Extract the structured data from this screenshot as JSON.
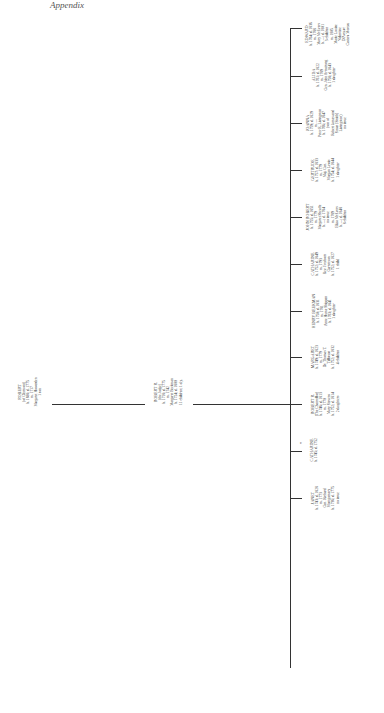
{
  "header": {
    "text": "Appendix"
  },
  "root": {
    "name": "ROBERT",
    "lines": [
      "(of Clermont)",
      "b. 1688; d. 1775",
      "m. 1717",
      "Margaret Howarden",
      "1 son"
    ]
  },
  "middle": {
    "name": "ROBERT R.",
    "lines": [
      "(the Judge)",
      "b. 1718; d. 1775",
      "m. 1742",
      "Margaret Beekman",
      "b. 1724; d. 1800",
      "11 children; 1 d.y."
    ]
  },
  "mark": {
    "text": "c"
  },
  "children": [
    {
      "name": "JANET",
      "lines": [
        "b. 1743; d. 1828",
        "m. 1773",
        "Gen. Richard",
        "Montgomery",
        "b. 1736; d. 1775",
        "no issue"
      ]
    },
    {
      "name": "CATHARINE",
      "lines": [
        "b. 1745; d. 1752"
      ]
    },
    {
      "name": "ROBERT R.",
      "lines": [
        "(The Chancellor)",
        "b. 1746; d. 1813",
        "m. 1770",
        "Mary Stevens",
        "b. 1752; d. 1814",
        "2 daughters"
      ]
    },
    {
      "name": "MARGARET",
      "lines": [
        "b. 1749; d. 1823",
        "m. 1779",
        "Dr. Thomas T.",
        "Tillotson",
        "b. 1752; d. 1832",
        "4 children"
      ]
    },
    {
      "name": "HENRY BEEKMAN",
      "lines": [
        "b. 1750; d. 1831",
        "m. 1781",
        "Anne Hume Shippen",
        "b. 1763; d. 1841",
        "1 daughter"
      ]
    },
    {
      "name": "CATHARINE",
      "lines": [
        "b. 1752; d. 1849",
        "m. 1793",
        "Rev. Freeborn",
        "Garrettson",
        "b. 1752; d. 1827",
        "1 child"
      ]
    },
    {
      "name": "JOHN ROBERT",
      "lines": [
        "b. 1755; d. 1851",
        "m. 1779",
        "Margaret Sheaffe",
        "b. —; d. 1784",
        "no issue",
        "m. 1789",
        "Eliza McEvers",
        "b. —; d. 1848",
        "8 children"
      ]
    },
    {
      "name": "GERTRUDE",
      "lines": [
        "b. 1757; d. 1833",
        "m. 1779",
        "Maj. Gen.",
        "Morgan Lewis",
        "b. 1754; d. 1844",
        "1 daughter"
      ]
    },
    {
      "name": "JOANNA",
      "lines": [
        "b. 1759; d. 1829",
        "m. —",
        "Peter R. Livingston",
        "b. 1766; d. 1847",
        "(son of",
        "Robert James and",
        "Susan [Smith]",
        "Livingston)",
        "no issue"
      ]
    },
    {
      "name": "ALIDA",
      "lines": [
        "b. 1761; d. 1822",
        "m. 1789",
        "Gen. John Armstrong",
        "b. 1758; d. 1843",
        "1 daughter"
      ]
    },
    {
      "name": "EDWARD",
      "lines": [
        "b. 1764; d. 1836",
        "m. 1788",
        "Mary McEvers",
        "b. —; d. 1801",
        "3 children",
        "m. 1805",
        "Marie Louise",
        "Valentine",
        "D'Avezac",
        "Castera Moreau"
      ]
    }
  ]
}
